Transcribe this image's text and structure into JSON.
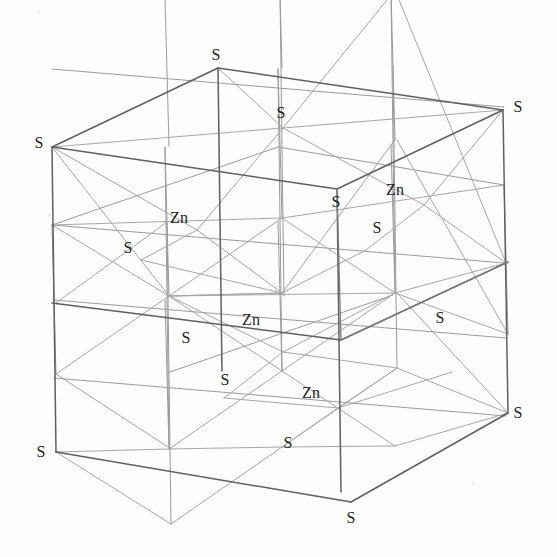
{
  "figure": {
    "kind": "crystal-structure-unit-cell",
    "compound": "ZnS",
    "structure_name": "zinc blende",
    "background_color": "#fdfdfd",
    "width": 557,
    "height": 557
  },
  "style": {
    "edge_color_outer": "#5f5f5f",
    "edge_color_inner": "#9a9a9a",
    "edge_color_mid": "#7d7d7d",
    "bond_color": "#a6a6a6",
    "label_color": "#1d1d1d",
    "label_font_size": "16px",
    "edge_width_outer": 1.5,
    "edge_width_inner": 1.0
  },
  "projection": {
    "origin": [
      52,
      303
    ],
    "axis_x": [
      226,
      55
    ],
    "axis_y": [
      0,
      -156
    ],
    "axis_z": [
      4,
      149
    ],
    "note": "oblique: origin is left-mid vertex; x to upper-right, y up, z to lower-right"
  },
  "legend_species": [
    {
      "symbol": "S",
      "name": "sulfur"
    },
    {
      "symbol": "Zn",
      "name": "zinc"
    }
  ],
  "labels": [
    {
      "id": "s-top-back",
      "text": "S",
      "x": 216,
      "y": 55
    },
    {
      "id": "s-top-center",
      "text": "S",
      "x": 281,
      "y": 113
    },
    {
      "id": "s-top-right-front",
      "text": "S",
      "x": 518,
      "y": 107
    },
    {
      "id": "s-left-top-front",
      "text": "S",
      "x": 39,
      "y": 143
    },
    {
      "id": "s-mid-upper-right",
      "text": "S",
      "x": 336,
      "y": 202
    },
    {
      "id": "zn-upper-right",
      "text": "Zn",
      "x": 395,
      "y": 190
    },
    {
      "id": "zn-upper-left",
      "text": "Zn",
      "x": 179,
      "y": 218
    },
    {
      "id": "s-inner-right",
      "text": "S",
      "x": 377,
      "y": 228
    },
    {
      "id": "s-mid-left",
      "text": "S",
      "x": 128,
      "y": 248
    },
    {
      "id": "zn-center",
      "text": "Zn",
      "x": 251,
      "y": 320
    },
    {
      "id": "s-mid-front",
      "text": "S",
      "x": 186,
      "y": 338
    },
    {
      "id": "s-mid-right",
      "text": "S",
      "x": 440,
      "y": 318
    },
    {
      "id": "s-lower-left",
      "text": "S",
      "x": 225,
      "y": 380
    },
    {
      "id": "zn-lower",
      "text": "Zn",
      "x": 311,
      "y": 393
    },
    {
      "id": "s-bottom-right",
      "text": "S",
      "x": 518,
      "y": 413
    },
    {
      "id": "s-bottom-center",
      "text": "S",
      "x": 288,
      "y": 443
    },
    {
      "id": "s-bottom-left",
      "text": "S",
      "x": 41,
      "y": 452
    },
    {
      "id": "s-bottom-front",
      "text": "S",
      "x": 351,
      "y": 518
    }
  ],
  "atom_count": {
    "S": 14,
    "Zn": 4
  }
}
